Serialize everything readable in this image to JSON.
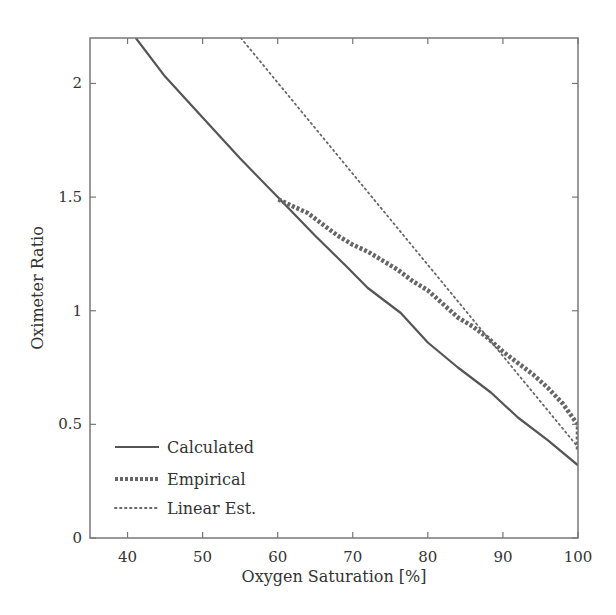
{
  "chart_data": {
    "type": "line",
    "title": "",
    "xlabel": "Oxygen Saturation [%]",
    "ylabel": "Oximeter Ratio",
    "xlim": [
      35,
      100
    ],
    "ylim": [
      0,
      2.2
    ],
    "xticks": [
      40,
      50,
      60,
      70,
      80,
      90,
      100
    ],
    "yticks": [
      0,
      0.5,
      1,
      1.5,
      2
    ],
    "xtick_labels": [
      "40",
      "50",
      "60",
      "70",
      "80",
      "90",
      "100"
    ],
    "ytick_labels": [
      "0",
      "0.5",
      "1",
      "1.5",
      "2"
    ],
    "grid": false,
    "legend_position": "lower left",
    "series": [
      {
        "name": "Calculated",
        "style": "solid",
        "color": "#555555",
        "x": [
          41.1,
          45,
          50,
          55,
          60,
          65,
          69,
          72,
          76.4,
          80,
          84,
          88.4,
          92,
          96,
          100
        ],
        "y": [
          2.2,
          2.03,
          1.85,
          1.67,
          1.5,
          1.33,
          1.2,
          1.1,
          0.99,
          0.86,
          0.75,
          0.64,
          0.53,
          0.43,
          0.32
        ]
      },
      {
        "name": "Empirical",
        "style": "dashed-thick",
        "color": "#666666",
        "x": [
          60.1,
          62,
          64,
          66,
          68,
          70,
          72,
          74,
          76,
          78,
          80,
          82,
          84,
          86,
          88,
          90,
          92,
          94,
          96,
          98,
          99.5,
          100,
          100
        ],
        "y": [
          1.49,
          1.46,
          1.43,
          1.38,
          1.33,
          1.29,
          1.26,
          1.22,
          1.18,
          1.13,
          1.09,
          1.03,
          0.97,
          0.93,
          0.88,
          0.82,
          0.77,
          0.72,
          0.66,
          0.59,
          0.52,
          0.5,
          0.39
        ]
      },
      {
        "name": "Linear Est.",
        "style": "dotted",
        "color": "#666666",
        "x": [
          55.1,
          100
        ],
        "y": [
          2.2,
          0.4
        ]
      }
    ]
  },
  "legend": {
    "items": [
      {
        "label": "Calculated"
      },
      {
        "label": "Empirical"
      },
      {
        "label": "Linear Est."
      }
    ]
  },
  "axes": {
    "xlabel": "Oxygen Saturation [%]",
    "ylabel": "Oximeter Ratio"
  }
}
